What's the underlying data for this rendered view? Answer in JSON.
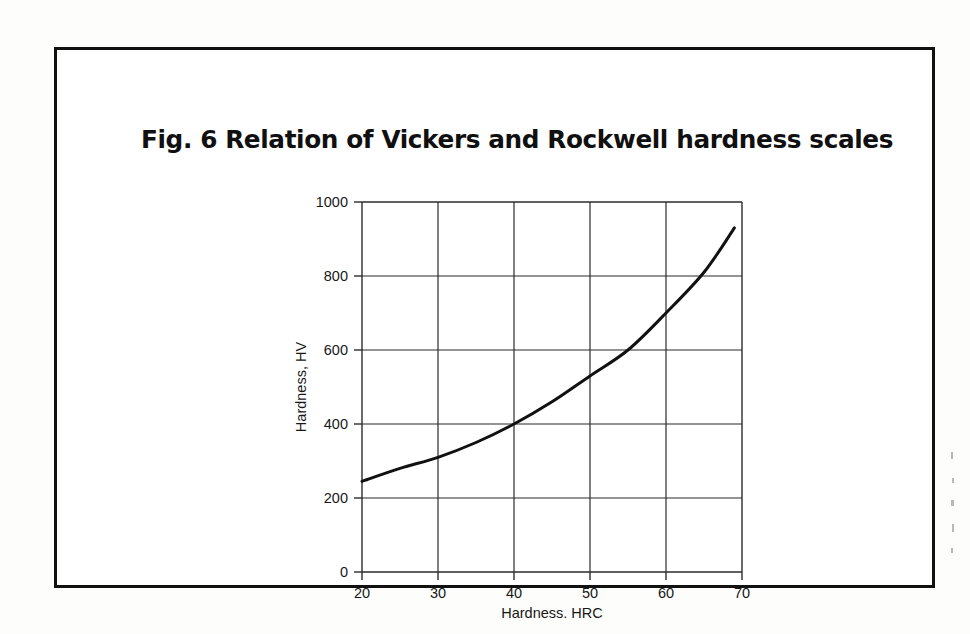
{
  "figure": {
    "title": "Fig. 6 Relation of Vickers and Rockwell hardness scales",
    "frame_color": "#111111",
    "background_color": "#ffffff"
  },
  "chart_data": {
    "type": "line",
    "title": "Fig. 6 Relation of Vickers and Rockwell hardness scales",
    "xlabel": "Hardness, HRC",
    "ylabel": "Hardness, HV",
    "xlim": [
      20,
      70
    ],
    "ylim": [
      0,
      1000
    ],
    "xticks": [
      20,
      30,
      40,
      50,
      60,
      70
    ],
    "yticks": [
      0,
      200,
      400,
      600,
      800,
      1000
    ],
    "xtick_labels": [
      "20",
      "30",
      "40",
      "50",
      "60",
      "70"
    ],
    "ytick_labels": [
      "0",
      "200",
      "400",
      "600",
      "800",
      "1000"
    ],
    "grid": true,
    "grid_color": "#2b2b2b",
    "legend": null,
    "series": [
      {
        "name": "Vickers vs Rockwell C conversion",
        "color": "#111111",
        "line_width": 3,
        "x": [
          20,
          22,
          24,
          26,
          28,
          30,
          32,
          34,
          36,
          38,
          40,
          42,
          44,
          46,
          48,
          50,
          52,
          54,
          56,
          58,
          60,
          62,
          64,
          66,
          68,
          69
        ],
        "y": [
          245,
          258,
          272,
          288,
          305,
          324,
          344,
          366,
          389,
          415,
          400,
          427,
          455,
          486,
          520,
          560,
          600,
          640,
          680,
          720,
          760,
          800,
          840,
          880,
          915,
          930
        ]
      }
    ],
    "curve_points": [
      {
        "hrc": 20,
        "hv": 245
      },
      {
        "hrc": 25,
        "hv": 280
      },
      {
        "hrc": 30,
        "hv": 310
      },
      {
        "hrc": 35,
        "hv": 350
      },
      {
        "hrc": 40,
        "hv": 400
      },
      {
        "hrc": 45,
        "hv": 460
      },
      {
        "hrc": 50,
        "hv": 530
      },
      {
        "hrc": 55,
        "hv": 600
      },
      {
        "hrc": 60,
        "hv": 700
      },
      {
        "hrc": 65,
        "hv": 810
      },
      {
        "hrc": 69,
        "hv": 930
      }
    ],
    "annotations": []
  },
  "axes": {
    "x_title": "Hardness, HRC",
    "y_title": "Hardness, HV"
  }
}
